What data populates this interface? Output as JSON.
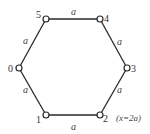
{
  "diagram": {
    "type": "hexagon-graph",
    "nodes": [
      {
        "id": "0",
        "label": "0"
      },
      {
        "id": "1",
        "label": "1"
      },
      {
        "id": "2",
        "label": "2"
      },
      {
        "id": "3",
        "label": "3"
      },
      {
        "id": "4",
        "label": "4"
      },
      {
        "id": "5",
        "label": "5"
      }
    ],
    "edges": [
      {
        "from": "5",
        "to": "4",
        "label": "a"
      },
      {
        "from": "4",
        "to": "3",
        "label": "a"
      },
      {
        "from": "3",
        "to": "2",
        "label": "a"
      },
      {
        "from": "2",
        "to": "1",
        "label": "a"
      },
      {
        "from": "1",
        "to": "0",
        "label": "a"
      },
      {
        "from": "0",
        "to": "5",
        "label": "a"
      }
    ],
    "annotation": "(x=2a)"
  }
}
